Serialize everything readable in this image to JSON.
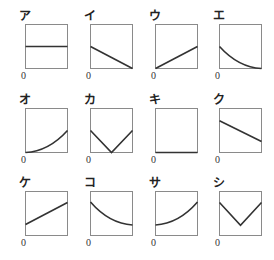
{
  "origin_label": "0",
  "style": {
    "frame_color": "#8a8a8a",
    "curve_color": "#333333"
  },
  "graphs": [
    {
      "label": "ア",
      "shape": "horizontal line at half height",
      "points": [
        [
          0,
          0.5
        ],
        [
          1,
          0.5
        ]
      ],
      "curve": "line",
      "x": 25,
      "y": 24
    },
    {
      "label": "イ",
      "shape": "decreasing straight line to zero",
      "points": [
        [
          0,
          0.5
        ],
        [
          1,
          0
        ]
      ],
      "curve": "line",
      "x": 90,
      "y": 24
    },
    {
      "label": "ウ",
      "shape": "increasing straight line from origin",
      "points": [
        [
          0,
          0
        ],
        [
          1,
          0.5
        ]
      ],
      "curve": "line",
      "x": 155,
      "y": 24
    },
    {
      "label": "エ",
      "shape": "decreasing convex curve to zero",
      "points": [
        [
          0,
          0.5
        ],
        [
          1,
          0
        ]
      ],
      "curve": "convex-decreasing",
      "x": 219,
      "y": 24
    },
    {
      "label": "オ",
      "shape": "increasing convex curve from origin",
      "points": [
        [
          0,
          0
        ],
        [
          1,
          0.5
        ]
      ],
      "curve": "convex-increasing",
      "x": 25,
      "y": 108
    },
    {
      "label": "カ",
      "shape": "V shape touching zero at middle",
      "points": [
        [
          0,
          0.5
        ],
        [
          0.5,
          0
        ],
        [
          1,
          0.5
        ]
      ],
      "curve": "line",
      "x": 90,
      "y": 108
    },
    {
      "label": "キ",
      "shape": "horizontal line at zero",
      "points": [
        [
          0,
          0
        ],
        [
          1,
          0
        ]
      ],
      "curve": "line",
      "x": 155,
      "y": 108
    },
    {
      "label": "ク",
      "shape": "decreasing straight line",
      "points": [
        [
          0,
          0.72
        ],
        [
          1,
          0.25
        ]
      ],
      "curve": "line",
      "x": 219,
      "y": 108
    },
    {
      "label": "ケ",
      "shape": "increasing straight line",
      "points": [
        [
          0,
          0.25
        ],
        [
          1,
          0.75
        ]
      ],
      "curve": "line",
      "x": 25,
      "y": 191
    },
    {
      "label": "コ",
      "shape": "decreasing convex curve",
      "points": [
        [
          0,
          0.76
        ],
        [
          1,
          0.24
        ]
      ],
      "curve": "convex-decreasing",
      "x": 90,
      "y": 191
    },
    {
      "label": "サ",
      "shape": "increasing convex curve",
      "points": [
        [
          0,
          0.24
        ],
        [
          1,
          0.76
        ]
      ],
      "curve": "convex-increasing",
      "x": 155,
      "y": 191
    },
    {
      "label": "シ",
      "shape": "V shape with positive minimum",
      "points": [
        [
          0,
          0.75
        ],
        [
          0.5,
          0.23
        ],
        [
          1,
          0.75
        ]
      ],
      "curve": "line",
      "x": 219,
      "y": 191
    }
  ]
}
